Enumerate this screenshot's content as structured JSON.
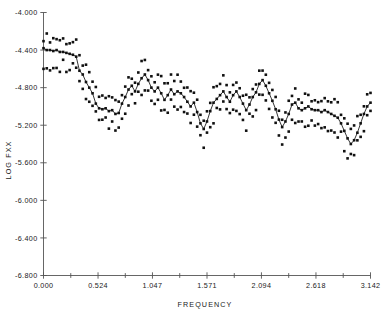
{
  "chart_data": {
    "type": "line",
    "title": "",
    "subtitle": "",
    "xlabel": "FREQUENCY",
    "ylabel": "LOG FXX",
    "xlim": [
      0.0,
      3.142
    ],
    "ylim": [
      -6.8,
      -4.0
    ],
    "grid": false,
    "legend": "none",
    "xticks": [
      0.0,
      0.524,
      1.047,
      1.571,
      2.094,
      2.618,
      3.142
    ],
    "xticklabels": [
      "0.000",
      "0.524",
      "1.047",
      "1.571",
      "2.094",
      "2.618",
      "3.142"
    ],
    "x_minor_ticks": [
      0.262,
      0.786,
      1.309,
      1.833,
      2.356,
      2.88
    ],
    "yticks": [
      -4.0,
      -4.4,
      -4.8,
      -5.2,
      -5.6,
      -6.0,
      -6.4,
      -6.8
    ],
    "yticklabels": [
      "-4.000",
      "-4.400",
      "-4.800",
      "-5.200",
      "-5.600",
      "-6.000",
      "-6.400",
      "-6.800"
    ],
    "marker": "square",
    "marker_size": 2.6,
    "series": [
      {
        "name": "spectral estimate",
        "style": "line+markers",
        "x": [
          0.0,
          0.0314,
          0.0628,
          0.0942,
          0.1257,
          0.1571,
          0.1885,
          0.2199,
          0.2513,
          0.2827,
          0.3142,
          0.3456,
          0.377,
          0.4084,
          0.4398,
          0.4712,
          0.5027,
          0.5341,
          0.5655,
          0.5969,
          0.6283,
          0.6597,
          0.6912,
          0.7226,
          0.754,
          0.7854,
          0.8168,
          0.8482,
          0.8796,
          0.9111,
          0.9425,
          0.9739,
          1.0053,
          1.0367,
          1.0681,
          1.0996,
          1.131,
          1.1624,
          1.1938,
          1.2252,
          1.2566,
          1.2881,
          1.3195,
          1.3509,
          1.3823,
          1.4137,
          1.4451,
          1.4765,
          1.508,
          1.5394,
          1.5708,
          1.6022,
          1.6336,
          1.665,
          1.6965,
          1.7279,
          1.7593,
          1.7907,
          1.8221,
          1.8535,
          1.885,
          1.9164,
          1.9478,
          1.9792,
          2.0106,
          2.042,
          2.0735,
          2.1049,
          2.1363,
          2.1677,
          2.1991,
          2.2305,
          2.2619,
          2.2934,
          2.3248,
          2.3562,
          2.3876,
          2.419,
          2.4504,
          2.4819,
          2.5133,
          2.5447,
          2.5761,
          2.6075,
          2.6389,
          2.6704,
          2.7018,
          2.7332,
          2.7646,
          2.796,
          2.8274,
          2.8588,
          2.8903,
          2.9217,
          2.9531,
          2.9845,
          3.0159,
          3.0473,
          3.0788,
          3.1102,
          3.142
        ],
        "y": [
          -4.38,
          -4.4,
          -4.4,
          -4.41,
          -4.4,
          -4.42,
          -4.42,
          -4.43,
          -4.44,
          -4.45,
          -4.47,
          -4.62,
          -4.66,
          -4.74,
          -4.8,
          -4.86,
          -4.97,
          -5.02,
          -5.03,
          -5.02,
          -5.05,
          -5.04,
          -5.08,
          -5.07,
          -4.97,
          -4.9,
          -4.82,
          -4.78,
          -4.84,
          -4.76,
          -4.7,
          -4.66,
          -4.72,
          -4.8,
          -4.84,
          -4.8,
          -4.86,
          -4.93,
          -4.88,
          -4.82,
          -4.87,
          -4.84,
          -4.86,
          -4.9,
          -4.95,
          -5.0,
          -4.96,
          -5.06,
          -5.18,
          -5.24,
          -5.16,
          -5.05,
          -4.96,
          -4.92,
          -4.88,
          -4.84,
          -4.9,
          -4.95,
          -4.88,
          -4.84,
          -4.9,
          -4.97,
          -5.04,
          -4.98,
          -4.9,
          -4.85,
          -4.76,
          -4.72,
          -4.78,
          -4.86,
          -4.94,
          -5.03,
          -5.14,
          -5.22,
          -5.16,
          -5.08,
          -4.98,
          -4.96,
          -5.02,
          -5.04,
          -5.02,
          -5.0,
          -5.03,
          -5.04,
          -5.04,
          -5.06,
          -5.04,
          -5.06,
          -5.08,
          -5.1,
          -5.12,
          -5.18,
          -5.26,
          -5.34,
          -5.4,
          -5.36,
          -5.28,
          -5.18,
          -5.08,
          -5.0,
          -4.96
        ]
      },
      {
        "name": "upper confidence bound",
        "style": "markers",
        "offset": 0.13
      },
      {
        "name": "lower confidence bound",
        "style": "markers",
        "offset": -0.15
      }
    ]
  }
}
